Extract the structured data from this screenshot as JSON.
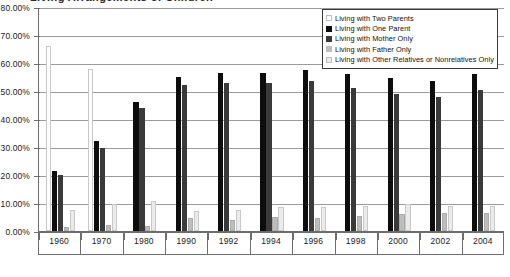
{
  "title_fragment": "Living Arrangements of Children",
  "legend": {
    "position": "top-right",
    "entries": [
      {
        "label": "Living with Two Parents",
        "color": "#fdfdfd"
      },
      {
        "label": "Living with One Parent",
        "color": "#0d0d0d"
      },
      {
        "label": "Living with Mother Only",
        "color": "#3a3a3a"
      },
      {
        "label": "Living with Father Only",
        "color": "#bdbdbd"
      },
      {
        "label": "Living with Other Relatives or Nonrelatives Only",
        "color": "#ebebeb"
      }
    ]
  },
  "axis": {
    "y_ticks": [
      "0.00%",
      "10.00%",
      "20.00%",
      "30.00%",
      "40.00%",
      "50.00%",
      "60.00%",
      "70.00%",
      "80.00%"
    ],
    "x_ticks": [
      "1960",
      "1970",
      "1980",
      "1990",
      "1992",
      "1994",
      "1996",
      "1998",
      "2000",
      "2002",
      "2004"
    ]
  },
  "chart_data": {
    "type": "bar",
    "title": "Living Arrangements of Children",
    "xlabel": "",
    "ylabel": "",
    "ylim": [
      0,
      80
    ],
    "ytick_step": 10,
    "ytick_format": "percent",
    "grid": true,
    "legend_position": "top-right",
    "categories": [
      "1960",
      "1970",
      "1980",
      "1990",
      "1992",
      "1994",
      "1996",
      "1998",
      "2000",
      "2002",
      "2004"
    ],
    "series": [
      {
        "name": "Living with Two Parents",
        "color": "#fdfdfd",
        "values": [
          66.0,
          58.0,
          0.0,
          0.0,
          0.0,
          0.0,
          0.0,
          0.0,
          0.0,
          0.0,
          0.0
        ]
      },
      {
        "name": "Living with One Parent",
        "color": "#0d0d0d",
        "values": [
          21.5,
          32.0,
          46.0,
          55.0,
          56.5,
          56.5,
          57.5,
          56.0,
          54.5,
          53.5,
          56.0
        ]
      },
      {
        "name": "Living with Mother Only",
        "color": "#3a3a3a",
        "values": [
          20.0,
          29.5,
          44.0,
          52.0,
          53.0,
          53.0,
          53.5,
          51.0,
          49.0,
          48.0,
          50.5
        ]
      },
      {
        "name": "Living with Father Only",
        "color": "#bdbdbd",
        "values": [
          1.5,
          2.0,
          1.8,
          4.5,
          4.0,
          5.0,
          4.5,
          5.5,
          6.0,
          6.5,
          6.5
        ]
      },
      {
        "name": "Living with Other Relatives or Nonrelatives Only",
        "color": "#ebebeb",
        "values": [
          7.5,
          9.8,
          10.8,
          7.0,
          7.5,
          8.5,
          8.5,
          9.0,
          9.5,
          9.0,
          9.0
        ]
      }
    ]
  }
}
